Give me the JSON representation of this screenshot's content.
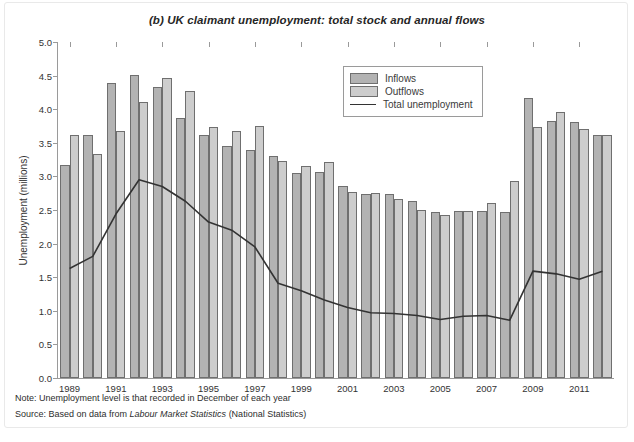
{
  "figure": {
    "title": "(b) UK claimant unemployment: total stock and annual flows",
    "note": "Note: Unemployment level is that recorded in December of each year",
    "source_prefix": "Source: Based on data from ",
    "source_italic": "Labour Market Statistics",
    "source_suffix": " (National Statistics)"
  },
  "legend": {
    "position": "top-right-inside",
    "items": [
      {
        "label": "Inflows",
        "type": "bar",
        "color": "#b3b3b3"
      },
      {
        "label": "Outflows",
        "type": "bar",
        "color": "#cdcdcd"
      },
      {
        "label": "Total unemployment",
        "type": "line",
        "color": "#333333"
      }
    ]
  },
  "chart_data": {
    "type": "bar",
    "title": "(b) UK claimant unemployment: total stock and annual flows",
    "xlabel": "",
    "ylabel": "Unemployment (millions)",
    "ylim": [
      0.0,
      5.0
    ],
    "ytick_values": [
      0.0,
      0.5,
      1.0,
      1.5,
      2.0,
      2.5,
      3.0,
      3.5,
      4.0,
      4.5,
      5.0
    ],
    "ytick_labels": [
      "0.0",
      "0.5",
      "1.0",
      "1.5",
      "2.0",
      "2.5",
      "3.0",
      "3.5",
      "4.0",
      "4.5",
      "5.0"
    ],
    "grid": false,
    "categories": [
      1989,
      1990,
      1991,
      1992,
      1993,
      1994,
      1995,
      1996,
      1997,
      1998,
      1999,
      2000,
      2001,
      2002,
      2003,
      2004,
      2005,
      2006,
      2007,
      2008,
      2009,
      2010,
      2011,
      2012
    ],
    "xtick_labels": [
      "1989",
      "1991",
      "1993",
      "1995",
      "1997",
      "1999",
      "2001",
      "2003",
      "2005",
      "2007",
      "2009",
      "2011"
    ],
    "xtick_values": [
      1989,
      1991,
      1993,
      1995,
      1997,
      1999,
      2001,
      2003,
      2005,
      2007,
      2009,
      2011
    ],
    "series": [
      {
        "name": "Inflows",
        "kind": "bar",
        "color": "#b3b3b3",
        "values": [
          3.17,
          3.61,
          4.39,
          4.51,
          4.33,
          3.87,
          3.61,
          3.46,
          3.4,
          3.31,
          3.05,
          3.06,
          2.85,
          2.74,
          2.74,
          2.64,
          2.47,
          2.49,
          2.48,
          2.47,
          4.17,
          3.82,
          3.81,
          3.61
        ]
      },
      {
        "name": "Outflows",
        "kind": "bar",
        "color": "#cdcdcd",
        "values": [
          3.61,
          3.33,
          3.67,
          4.1,
          4.47,
          4.27,
          3.74,
          3.67,
          3.75,
          3.23,
          3.16,
          3.22,
          2.77,
          2.76,
          2.67,
          2.5,
          2.43,
          2.49,
          2.61,
          2.93,
          3.74,
          3.96,
          3.71,
          3.62
        ]
      },
      {
        "name": "Total unemployment",
        "kind": "line",
        "color": "#333333",
        "values": [
          1.63,
          1.81,
          2.44,
          2.95,
          2.85,
          2.63,
          2.32,
          2.2,
          1.95,
          1.41,
          1.3,
          1.16,
          1.05,
          0.97,
          0.96,
          0.93,
          0.87,
          0.92,
          0.93,
          0.86,
          1.59,
          1.55,
          1.47,
          1.59
        ]
      }
    ]
  }
}
